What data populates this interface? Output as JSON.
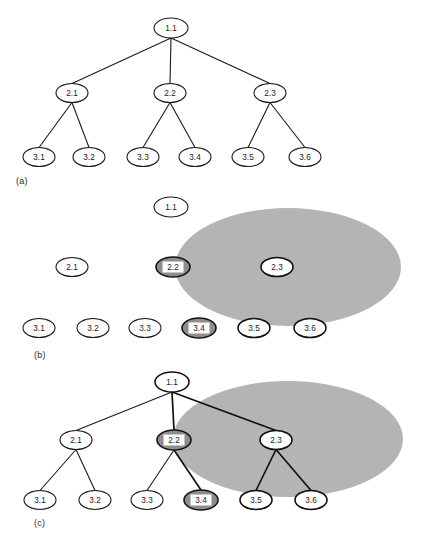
{
  "figure": {
    "width": 423,
    "height": 549,
    "background_color": "#ffffff",
    "region_color": "#b4b4b4",
    "node_fill": "#ffffff",
    "node_stroke": "#1a1a1a",
    "highlight_ring_color": "#8d8d8d",
    "highlight_label_bg": "#ffffff",
    "text_color": "#1a1a1a"
  },
  "panels": [
    {
      "id": "a",
      "label": "(a)",
      "label_x": 16,
      "label_y": 176,
      "description": "plain hierarchy tree",
      "has_region": false,
      "has_edges": true,
      "nodes": [
        {
          "id": "n11",
          "label": "1.1",
          "cx": 171,
          "cy": 28,
          "rx": 17,
          "ry": 10,
          "style": "plain"
        },
        {
          "id": "n21",
          "label": "2.1",
          "cx": 72,
          "cy": 93,
          "rx": 16,
          "ry": 9.5,
          "style": "plain"
        },
        {
          "id": "n22",
          "label": "2.2",
          "cx": 170,
          "cy": 93,
          "rx": 16,
          "ry": 9.5,
          "style": "plain"
        },
        {
          "id": "n23",
          "label": "2.3",
          "cx": 270,
          "cy": 93,
          "rx": 16,
          "ry": 9.5,
          "style": "plain"
        },
        {
          "id": "n31",
          "label": "3.1",
          "cx": 39,
          "cy": 157,
          "rx": 16,
          "ry": 9.5,
          "style": "plain"
        },
        {
          "id": "n32",
          "label": "3.2",
          "cx": 89,
          "cy": 157,
          "rx": 16,
          "ry": 9.5,
          "style": "plain"
        },
        {
          "id": "n33",
          "label": "3.3",
          "cx": 143,
          "cy": 157,
          "rx": 16,
          "ry": 9.5,
          "style": "plain"
        },
        {
          "id": "n34",
          "label": "3.4",
          "cx": 195,
          "cy": 157,
          "rx": 16,
          "ry": 9.5,
          "style": "plain"
        },
        {
          "id": "n35",
          "label": "3.5",
          "cx": 248,
          "cy": 157,
          "rx": 16,
          "ry": 9.5,
          "style": "plain"
        },
        {
          "id": "n36",
          "label": "3.6",
          "cx": 305,
          "cy": 157,
          "rx": 16,
          "ry": 9.5,
          "style": "plain"
        }
      ],
      "edges": [
        {
          "from": "n11",
          "to": "n21",
          "style": "plain"
        },
        {
          "from": "n11",
          "to": "n22",
          "style": "plain"
        },
        {
          "from": "n11",
          "to": "n23",
          "style": "plain"
        },
        {
          "from": "n21",
          "to": "n31",
          "style": "plain"
        },
        {
          "from": "n21",
          "to": "n32",
          "style": "plain"
        },
        {
          "from": "n22",
          "to": "n33",
          "style": "plain"
        },
        {
          "from": "n22",
          "to": "n34",
          "style": "plain"
        },
        {
          "from": "n23",
          "to": "n35",
          "style": "plain"
        },
        {
          "from": "n23",
          "to": "n36",
          "style": "plain"
        }
      ]
    },
    {
      "id": "b",
      "label": "(b)",
      "label_x": 34,
      "label_y": 350,
      "description": "nodes without edges, overlaid by grey region of interest",
      "has_region": true,
      "has_edges": false,
      "region": {
        "cx": 288,
        "cy": 267,
        "rx": 113,
        "ry": 59
      },
      "nodes": [
        {
          "id": "n11",
          "label": "1.1",
          "cx": 171,
          "cy": 207,
          "rx": 17,
          "ry": 10,
          "style": "plain"
        },
        {
          "id": "n21",
          "label": "2.1",
          "cx": 72,
          "cy": 267,
          "rx": 16,
          "ry": 9.5,
          "style": "plain"
        },
        {
          "id": "n22",
          "label": "2.2",
          "cx": 173,
          "cy": 267,
          "rx": 17,
          "ry": 10,
          "style": "highlight"
        },
        {
          "id": "n23",
          "label": "2.3",
          "cx": 277,
          "cy": 267,
          "rx": 16,
          "ry": 9.5,
          "style": "bold"
        },
        {
          "id": "n31",
          "label": "3.1",
          "cx": 39,
          "cy": 328,
          "rx": 16,
          "ry": 9.5,
          "style": "plain"
        },
        {
          "id": "n32",
          "label": "3.2",
          "cx": 93,
          "cy": 328,
          "rx": 16,
          "ry": 9.5,
          "style": "plain"
        },
        {
          "id": "n33",
          "label": "3.3",
          "cx": 145,
          "cy": 328,
          "rx": 16,
          "ry": 9.5,
          "style": "plain"
        },
        {
          "id": "n34",
          "label": "3.4",
          "cx": 199,
          "cy": 328,
          "rx": 17,
          "ry": 10,
          "style": "highlight"
        },
        {
          "id": "n35",
          "label": "3.5",
          "cx": 254,
          "cy": 328,
          "rx": 16,
          "ry": 9.5,
          "style": "bold"
        },
        {
          "id": "n36",
          "label": "3.6",
          "cx": 310,
          "cy": 328,
          "rx": 16,
          "ry": 9.5,
          "style": "bold"
        }
      ],
      "edges": []
    },
    {
      "id": "c",
      "label": "(c)",
      "label_x": 34,
      "label_y": 518,
      "description": "tree with grey region of interest overlaid, selected path in bold",
      "has_region": true,
      "has_edges": true,
      "region": {
        "cx": 288,
        "cy": 439,
        "rx": 115,
        "ry": 58
      },
      "nodes": [
        {
          "id": "n11",
          "label": "1.1",
          "cx": 172,
          "cy": 382,
          "rx": 17,
          "ry": 10,
          "style": "bold"
        },
        {
          "id": "n21",
          "label": "2.1",
          "cx": 76,
          "cy": 440,
          "rx": 16,
          "ry": 9.5,
          "style": "plain"
        },
        {
          "id": "n22",
          "label": "2.2",
          "cx": 174,
          "cy": 440,
          "rx": 17,
          "ry": 10,
          "style": "highlight"
        },
        {
          "id": "n23",
          "label": "2.3",
          "cx": 276,
          "cy": 440,
          "rx": 16,
          "ry": 9.5,
          "style": "bold"
        },
        {
          "id": "n31",
          "label": "3.1",
          "cx": 40,
          "cy": 500,
          "rx": 16,
          "ry": 9.5,
          "style": "plain"
        },
        {
          "id": "n32",
          "label": "3.2",
          "cx": 95,
          "cy": 500,
          "rx": 16,
          "ry": 9.5,
          "style": "plain"
        },
        {
          "id": "n33",
          "label": "3.3",
          "cx": 147,
          "cy": 500,
          "rx": 16,
          "ry": 9.5,
          "style": "plain"
        },
        {
          "id": "n34",
          "label": "3.4",
          "cx": 201,
          "cy": 500,
          "rx": 17,
          "ry": 10,
          "style": "highlight"
        },
        {
          "id": "n35",
          "label": "3.5",
          "cx": 256,
          "cy": 500,
          "rx": 16,
          "ry": 9.5,
          "style": "bold"
        },
        {
          "id": "n36",
          "label": "3.6",
          "cx": 311,
          "cy": 500,
          "rx": 16,
          "ry": 9.5,
          "style": "bold"
        }
      ],
      "edges": [
        {
          "from": "n11",
          "to": "n21",
          "style": "plain"
        },
        {
          "from": "n11",
          "to": "n22",
          "style": "bold"
        },
        {
          "from": "n11",
          "to": "n23",
          "style": "bold"
        },
        {
          "from": "n21",
          "to": "n31",
          "style": "plain"
        },
        {
          "from": "n21",
          "to": "n32",
          "style": "plain"
        },
        {
          "from": "n22",
          "to": "n33",
          "style": "plain"
        },
        {
          "from": "n22",
          "to": "n34",
          "style": "bold"
        },
        {
          "from": "n23",
          "to": "n35",
          "style": "bold"
        },
        {
          "from": "n23",
          "to": "n36",
          "style": "bold"
        }
      ]
    }
  ],
  "bottom_caption": ""
}
